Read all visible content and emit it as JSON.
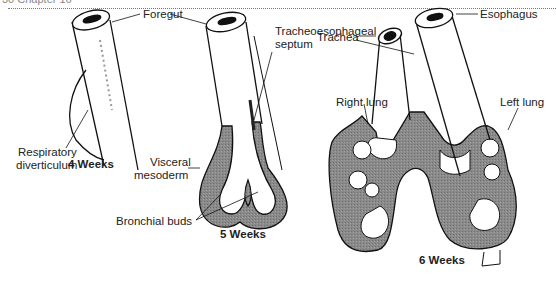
{
  "header": {
    "fragment": "30    Chapter 16"
  },
  "figure": {
    "fill_color": "#8a8a8a",
    "stages": [
      {
        "label": "4 Weeks",
        "annotations": [
          "Foregut",
          "Respiratory diverticulum"
        ]
      },
      {
        "label": "5 Weeks",
        "annotations": [
          "Tracheoesophageal septum",
          "Visceral mesoderm",
          "Bronchial buds"
        ]
      },
      {
        "label": "6 Weeks",
        "annotations": [
          "Esophagus",
          "Trachea",
          "Right lung",
          "Left lung"
        ]
      }
    ]
  },
  "labels": {
    "foregut": "Foregut",
    "resp_div_1": "Respiratory",
    "resp_div_2": "diverticulum",
    "week4": "4 Weeks",
    "tracheo_1": "Tracheoesophageal",
    "tracheo_2": "septum",
    "visceral_1": "Visceral",
    "visceral_2": "mesoderm",
    "bronchial": "Bronchial buds",
    "week5": "5 Weeks",
    "esophagus": "Esophagus",
    "trachea": "Trachea",
    "right_lung": "Right lung",
    "left_lung": "Left lung",
    "week6": "6 Weeks"
  }
}
